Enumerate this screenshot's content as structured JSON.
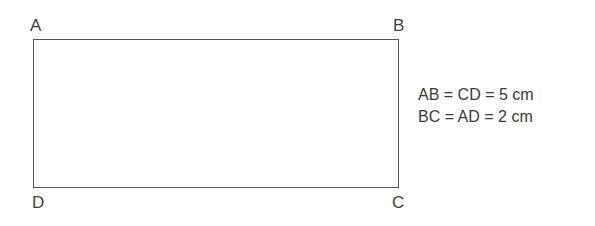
{
  "figure": {
    "shape": "rectangle",
    "vertices": [
      {
        "label": "A",
        "position": "top-left"
      },
      {
        "label": "B",
        "position": "top-right"
      },
      {
        "label": "C",
        "position": "bottom-right"
      },
      {
        "label": "D",
        "position": "bottom-left"
      }
    ],
    "annotations": [
      "AB = CD = 5 cm",
      "BC = AD = 2 cm"
    ],
    "colors": {
      "line": "#555555",
      "text": "#3a3a3a",
      "background": "#ffffff"
    }
  }
}
